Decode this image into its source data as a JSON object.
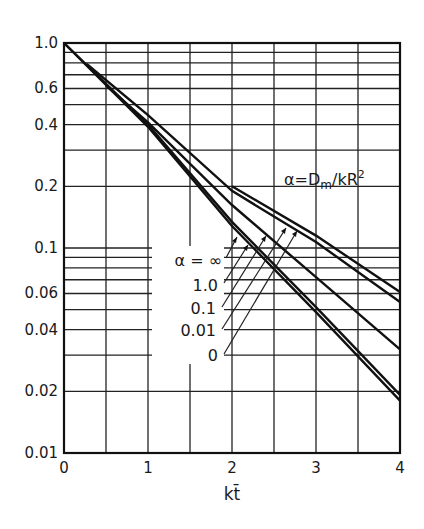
{
  "chart_data": {
    "type": "line",
    "title": "",
    "xlabel": "kt̄",
    "ylabel": "",
    "xlim": [
      0,
      4
    ],
    "ylim": [
      0.01,
      1.0
    ],
    "yscale": "log",
    "grid": true,
    "x_ticks": [
      "0",
      "1",
      "2",
      "3",
      "4"
    ],
    "y_ticks": [
      "1.0",
      "0.6",
      "0.4",
      "0.2",
      "0.1",
      "0.06",
      "0.04",
      "0.02",
      "0.01"
    ],
    "annotation": "α = Dm/kR²",
    "legend_title": "α =",
    "series": [
      {
        "name": "α = ∞",
        "x": [
          0,
          1,
          2,
          3,
          4
        ],
        "values": [
          1.0,
          0.39,
          0.128,
          0.0487,
          0.018
        ]
      },
      {
        "name": "α = 1.0",
        "x": [
          0,
          1,
          2,
          3,
          4
        ],
        "values": [
          1.0,
          0.4,
          0.134,
          0.0515,
          0.0192
        ]
      },
      {
        "name": "α = 0.1",
        "x": [
          0.5,
          1,
          2,
          3,
          4
        ],
        "values": [
          0.62,
          0.41,
          0.162,
          0.072,
          0.032
        ]
      },
      {
        "name": "α = 0.01",
        "x": [
          0.27,
          1,
          2,
          3,
          4
        ],
        "values": [
          0.79,
          0.445,
          0.19,
          0.107,
          0.0545
        ]
      },
      {
        "name": "α = 0",
        "x": [
          2,
          3,
          4
        ],
        "values": [
          0.2,
          0.115,
          0.061
        ]
      }
    ]
  },
  "labels": {
    "alpha_inf": "α = ∞",
    "alpha_1": "1.0",
    "alpha_01": "0.1",
    "alpha_001": "0.01",
    "alpha_0": "0",
    "formula_alpha": "α=D",
    "formula_sub": "m",
    "formula_rest": "/kR",
    "formula_sup": "2"
  }
}
